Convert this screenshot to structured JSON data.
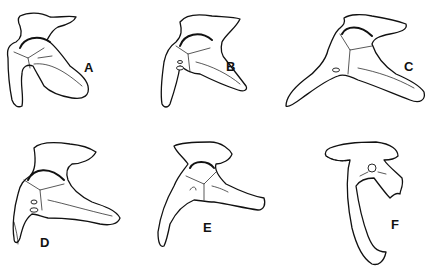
{
  "figure": {
    "type": "comparative anatomical line drawing",
    "panels": [
      {
        "id": "A",
        "label": "A"
      },
      {
        "id": "B",
        "label": "B"
      },
      {
        "id": "C",
        "label": "C"
      },
      {
        "id": "D",
        "label": "D"
      },
      {
        "id": "E",
        "label": "E"
      },
      {
        "id": "F",
        "label": "F"
      }
    ]
  },
  "colors": {
    "line": "#111111",
    "background": "#ffffff"
  }
}
